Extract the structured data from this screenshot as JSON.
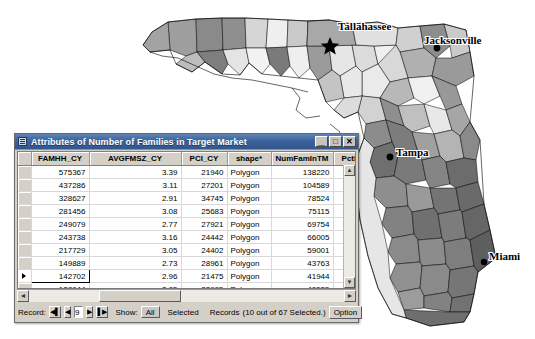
{
  "map": {
    "title": "Florida counties choropleth",
    "cities": [
      {
        "name": "Tallahassee",
        "marker": "star",
        "x": 330,
        "y": 44,
        "lx": 338,
        "ly": 30
      },
      {
        "name": "Jacksonville",
        "marker": "dot",
        "x": 437,
        "y": 48,
        "lx": 424,
        "ly": 42
      },
      {
        "name": "Tampa",
        "marker": "dot",
        "x": 392,
        "y": 156,
        "lx": 398,
        "ly": 152
      },
      {
        "name": "Miami",
        "marker": "dot",
        "x": 487,
        "y": 261,
        "lx": 490,
        "ly": 256
      }
    ]
  },
  "window": {
    "title": "Attributes of Number of Families in Target Market",
    "icon": "table-icon",
    "minimize_label": "_",
    "maximize_label": "□",
    "close_label": "✕"
  },
  "table": {
    "columns": [
      "FAMHH_CY",
      "AVGFMSZ_CY",
      "PCI_CY",
      "shape*",
      "NumFamInTM",
      "PctFam"
    ],
    "sort_indicator": "▲",
    "current_row_index": 8,
    "rows": [
      {
        "FAMHH_CY": "575367",
        "AVGFMSZ_CY": "3.39",
        "PCI_CY": "21940",
        "shape": "Polygon",
        "NumFamInTM": "138220",
        "PctFam": ""
      },
      {
        "FAMHH_CY": "437286",
        "AVGFMSZ_CY": "3.11",
        "PCI_CY": "27201",
        "shape": "Polygon",
        "NumFamInTM": "104589",
        "PctFam": ""
      },
      {
        "FAMHH_CY": "328627",
        "AVGFMSZ_CY": "2.91",
        "PCI_CY": "34745",
        "shape": "Polygon",
        "NumFamInTM": "78524",
        "PctFam": ""
      },
      {
        "FAMHH_CY": "281456",
        "AVGFMSZ_CY": "3.08",
        "PCI_CY": "25683",
        "shape": "Polygon",
        "NumFamInTM": "75115",
        "PctFam": ""
      },
      {
        "FAMHH_CY": "249079",
        "AVGFMSZ_CY": "2.77",
        "PCI_CY": "27921",
        "shape": "Polygon",
        "NumFamInTM": "69754",
        "PctFam": ""
      },
      {
        "FAMHH_CY": "243738",
        "AVGFMSZ_CY": "3.16",
        "PCI_CY": "24442",
        "shape": "Polygon",
        "NumFamInTM": "66005",
        "PctFam": ""
      },
      {
        "FAMHH_CY": "217729",
        "AVGFMSZ_CY": "3.05",
        "PCI_CY": "24402",
        "shape": "Polygon",
        "NumFamInTM": "59001",
        "PctFam": ""
      },
      {
        "FAMHH_CY": "149889",
        "AVGFMSZ_CY": "2.73",
        "PCI_CY": "28961",
        "shape": "Polygon",
        "NumFamInTM": "43763",
        "PctFam": ""
      },
      {
        "FAMHH_CY": "142702",
        "AVGFMSZ_CY": "2.96",
        "PCI_CY": "21475",
        "shape": "Polygon",
        "NumFamInTM": "41944",
        "PctFam": ""
      },
      {
        "FAMHH_CY": "128944",
        "AVGFMSZ_CY": "2.85",
        "PCI_CY": "22985",
        "shape": "Polygon",
        "NumFamInTM": "40535",
        "PctFam": ""
      },
      {
        "FAMHH_CY": "143274",
        "AVGFMSZ_CY": "2.84",
        "PCI_CY": "25174",
        "shape": "Polygon",
        "NumFamInTM": "40204",
        "PctFam": ""
      },
      {
        "FAMHH_CY": "111840",
        "AVGFMSZ_CY": "2.77",
        "PCI_CY": "21224",
        "shape": "Polygon",
        "NumFamInTM": "35230",
        "PctFam": ""
      },
      {
        "FAMHH_CY": "105507",
        "AVGFMSZ_CY": "2.62",
        "PCI_CY": "22570",
        "shape": "Polygon",
        "NumFamInTM": "30195",
        "PctFam": ""
      }
    ]
  },
  "statusbar": {
    "record_label": "Record:",
    "first_icon": "◀▌",
    "prev_icon": "◀",
    "record_value": "9",
    "next_icon": "▶",
    "last_icon": "▌▶",
    "show_label": "Show:",
    "show_all": "All",
    "show_selected": "Selected",
    "records_label": "Records",
    "records_status": "(10 out of 67 Selected.)",
    "options_label": "Option"
  },
  "scrollbars": {
    "left_arrow": "◄",
    "right_arrow": "►",
    "up_arrow": "▲",
    "down_arrow": "▼"
  }
}
